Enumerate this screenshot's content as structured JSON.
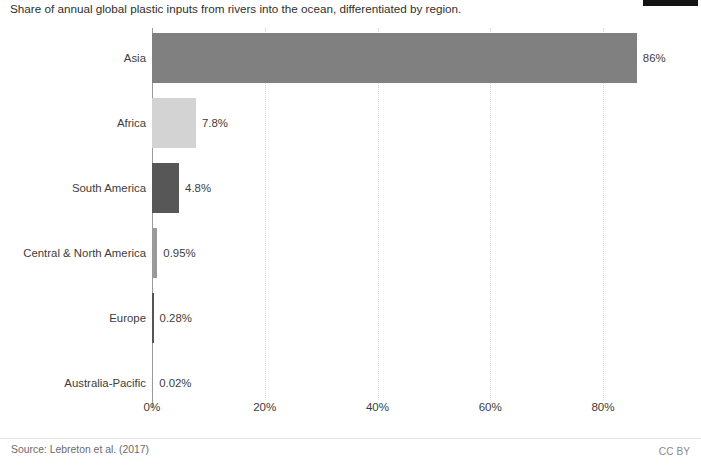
{
  "header": {
    "title": "Share of annual global plastic inputs from rivers into the ocean, differentiated by region."
  },
  "footer": {
    "source": "Source: Lebreton et al. (2017)",
    "license": "CC BY"
  },
  "colors": {
    "asia": "#808080",
    "africa": "#d3d3d3",
    "south_america": "#575757",
    "central_north_america": "#9a9a9a",
    "europe": "#555555",
    "australia_pacific": "#9a9a9a",
    "axis": "#9a9a9a",
    "gridline": "#d8d8d8",
    "text": "#3d3d3d"
  },
  "chart_data": {
    "type": "bar",
    "orientation": "horizontal",
    "title": "Share of annual global plastic inputs from rivers into the ocean, differentiated by region.",
    "xlabel": "",
    "ylabel": "",
    "xlim": [
      0,
      90
    ],
    "grid": true,
    "legend": "none",
    "xticks": [
      "0%",
      "20%",
      "40%",
      "60%",
      "80%"
    ],
    "xtick_values": [
      0,
      20,
      40,
      60,
      80
    ],
    "categories": [
      "Asia",
      "Africa",
      "South America",
      "Central & North America",
      "Europe",
      "Australia-Pacific"
    ],
    "values": [
      86,
      7.8,
      4.8,
      0.95,
      0.28,
      0.02
    ],
    "value_labels": [
      "86%",
      "7.8%",
      "4.8%",
      "0.95%",
      "0.28%",
      "0.02%"
    ],
    "bar_colors": [
      "#808080",
      "#d3d3d3",
      "#575757",
      "#9a9a9a",
      "#555555",
      "#9a9a9a"
    ]
  }
}
